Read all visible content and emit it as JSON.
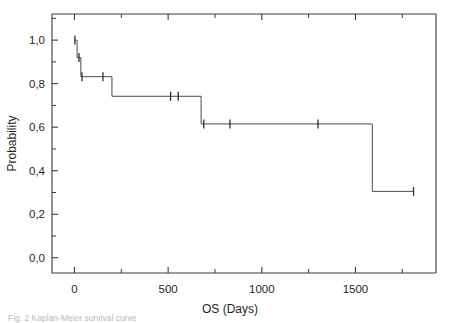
{
  "figure": {
    "caption": "Fig. 2  Kaplan-Meier survival curve",
    "background_color": "#ffffff",
    "line_color": "#4a4a4a",
    "axis_color": "#3a3a3a"
  },
  "chart_data": {
    "type": "line",
    "subtype": "kaplan-meier-step",
    "title": "",
    "xlabel": "OS (Days)",
    "ylabel": "Probability",
    "xlim": [
      -120,
      1930
    ],
    "ylim": [
      -0.07,
      1.12
    ],
    "grid": false,
    "legend": null,
    "x_ticks_major": [
      0,
      500,
      1000,
      1500
    ],
    "x_tick_labels": [
      "0",
      "500",
      "1000",
      "1500"
    ],
    "x_ticks_minor": [
      250,
      750,
      1250,
      1750
    ],
    "y_ticks_major": [
      0.0,
      0.2,
      0.4,
      0.6,
      0.8,
      1.0
    ],
    "y_tick_labels": [
      "0,0",
      "0,2",
      "0,4",
      "0,6",
      "0,8",
      "1,0"
    ],
    "y_ticks_minor": [
      0.1,
      0.3,
      0.5,
      0.7,
      0.9,
      1.1
    ],
    "decimal_separator": ",",
    "series": [
      {
        "name": "Overall survival",
        "steps": [
          {
            "x": 0,
            "y": 1.0
          },
          {
            "x": 14,
            "y": 1.0
          },
          {
            "x": 14,
            "y": 0.92
          },
          {
            "x": 34,
            "y": 0.92
          },
          {
            "x": 34,
            "y": 0.832
          },
          {
            "x": 200,
            "y": 0.832
          },
          {
            "x": 200,
            "y": 0.742
          },
          {
            "x": 676,
            "y": 0.742
          },
          {
            "x": 676,
            "y": 0.615
          },
          {
            "x": 1590,
            "y": 0.615
          },
          {
            "x": 1590,
            "y": 0.305
          },
          {
            "x": 1810,
            "y": 0.305
          }
        ],
        "censored": [
          {
            "x": 2,
            "y": 1.0
          },
          {
            "x": 24,
            "y": 0.92
          },
          {
            "x": 40,
            "y": 0.832
          },
          {
            "x": 152,
            "y": 0.832
          },
          {
            "x": 513,
            "y": 0.742
          },
          {
            "x": 554,
            "y": 0.742
          },
          {
            "x": 690,
            "y": 0.615
          },
          {
            "x": 830,
            "y": 0.615
          },
          {
            "x": 1300,
            "y": 0.615
          },
          {
            "x": 1810,
            "y": 0.305
          }
        ]
      }
    ]
  }
}
